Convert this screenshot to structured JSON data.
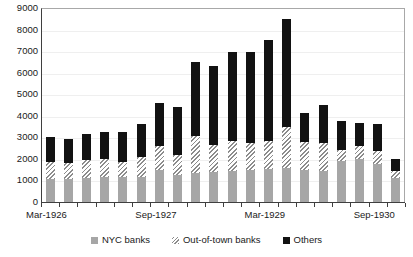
{
  "chart_data": {
    "type": "bar",
    "stacked": true,
    "title": "",
    "xlabel": "",
    "ylabel": "",
    "ylim": [
      0,
      9000
    ],
    "ytick_step": 1000,
    "yticks": [
      "9000",
      "8000",
      "7000",
      "6000",
      "5000",
      "4000",
      "3000",
      "2000",
      "1000",
      "0"
    ],
    "grid": true,
    "legend_position": "bottom",
    "categories": [
      "Mar-1926",
      "Jun-1926",
      "Sep-1926",
      "Dec-1926",
      "Mar-1927",
      "Jun-1927",
      "Sep-1927",
      "Dec-1927",
      "Mar-1928",
      "Jun-1928",
      "Sep-1928",
      "Dec-1928",
      "Mar-1929",
      "Jun-1929",
      "Sep-1929",
      "Dec-1929",
      "Mar-1930",
      "Jun-1930",
      "Sep-1930",
      "Dec-1930"
    ],
    "xtick_labels": [
      "Mar-1926",
      "Sep-1927",
      "Mar-1929",
      "Sep-1930"
    ],
    "xtick_label_indices": [
      0,
      6,
      12,
      18
    ],
    "series": [
      {
        "name": "NYC banks",
        "color": "#a6a6a6",
        "values": [
          1050,
          1080,
          1120,
          1150,
          1180,
          1150,
          1500,
          1250,
          1350,
          1400,
          1450,
          1500,
          1550,
          1600,
          1500,
          1450,
          1900,
          2000,
          1750,
          1100
        ]
      },
      {
        "name": "Out-of-town banks",
        "color": "#8c8c8c",
        "pattern": "diagonal-hatch",
        "values": [
          800,
          750,
          850,
          850,
          680,
          950,
          1100,
          950,
          1700,
          1250,
          1400,
          1250,
          1300,
          1900,
          1300,
          1300,
          500,
          600,
          600,
          350
        ]
      },
      {
        "name": "Others",
        "color": "#121212",
        "values": [
          1150,
          1100,
          1200,
          1250,
          1400,
          1500,
          2000,
          2200,
          3450,
          3650,
          4100,
          4200,
          4650,
          5000,
          1350,
          1750,
          1350,
          1050,
          1250,
          550
        ]
      }
    ],
    "totals": [
      3000,
      2930,
      3170,
      3250,
      3260,
      3600,
      4600,
      4400,
      6500,
      6300,
      6950,
      6950,
      7500,
      8500,
      4150,
      4500,
      3750,
      3650,
      3600,
      2000
    ]
  },
  "legend": {
    "items": [
      {
        "label": "NYC banks",
        "swatch": "nyc-swatch"
      },
      {
        "label": "Out-of-town banks",
        "swatch": "out-of-town-swatch"
      },
      {
        "label": "Others",
        "swatch": "others-swatch"
      }
    ]
  }
}
